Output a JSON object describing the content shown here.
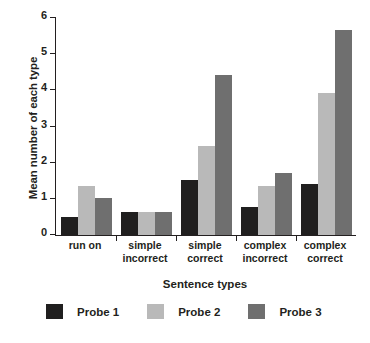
{
  "chart_data": {
    "type": "bar",
    "title": "",
    "xlabel": "Sentence types",
    "ylabel": "Mean number of each type",
    "ylim": [
      0,
      6
    ],
    "yticks": [
      0,
      1,
      2,
      3,
      4,
      5,
      6
    ],
    "grid": false,
    "legend_position": "bottom",
    "categories": [
      "run on",
      "simple incorrect",
      "simple correct",
      "complex incorrect",
      "complex correct"
    ],
    "category_lines": [
      [
        "run on"
      ],
      [
        "simple",
        "incorrect"
      ],
      [
        "simple",
        "correct"
      ],
      [
        "complex",
        "incorrect"
      ],
      [
        "complex",
        "correct"
      ]
    ],
    "series": [
      {
        "name": "Probe 1",
        "color": "#201f1f",
        "values": [
          0.5,
          0.65,
          1.52,
          0.78,
          1.42
        ]
      },
      {
        "name": "Probe 2",
        "color": "#b9b9b9",
        "values": [
          1.35,
          0.63,
          2.45,
          1.35,
          3.92
        ]
      },
      {
        "name": "Probe 3",
        "color": "#6f6f6f",
        "values": [
          1.02,
          0.63,
          4.42,
          1.72,
          5.68
        ]
      }
    ]
  }
}
